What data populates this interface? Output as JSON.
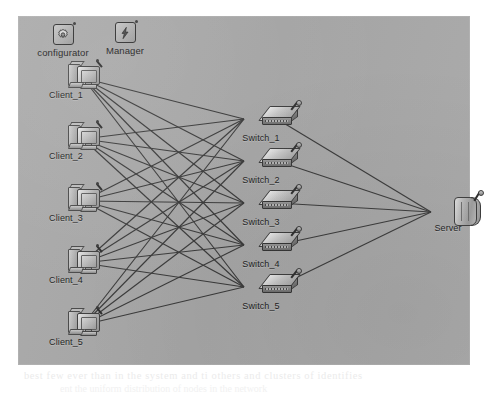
{
  "figure": {
    "kind": "network-topology-diagram",
    "panel_background": "#a9a9a9"
  },
  "app_shortcuts": [
    {
      "name": "configurator",
      "label": "configurator",
      "icon": "gear-icon",
      "x": 45,
      "y": 8
    },
    {
      "name": "manager",
      "label": "Manager",
      "icon": "lightning-bolt-icon",
      "x": 107,
      "y": 6
    }
  ],
  "nodes": {
    "clients": [
      {
        "id": "client_1",
        "label": "Client_1",
        "icon": "workstation-icon",
        "x": 48,
        "y": 45
      },
      {
        "id": "client_2",
        "label": "Client_2",
        "icon": "workstation-icon",
        "x": 48,
        "y": 106
      },
      {
        "id": "client_3",
        "label": "Client_3",
        "icon": "workstation-icon",
        "x": 48,
        "y": 168
      },
      {
        "id": "client_4",
        "label": "Client_4",
        "icon": "workstation-icon",
        "x": 48,
        "y": 230
      },
      {
        "id": "client_5",
        "label": "Client_5",
        "icon": "workstation-icon",
        "x": 48,
        "y": 292
      }
    ],
    "switches": [
      {
        "id": "switch_1",
        "label": "Switch_1",
        "icon": "network-switch-icon",
        "x": 243,
        "y": 88
      },
      {
        "id": "switch_2",
        "label": "Switch_2",
        "icon": "network-switch-icon",
        "x": 243,
        "y": 130
      },
      {
        "id": "switch_3",
        "label": "Switch_3",
        "icon": "network-switch-icon",
        "x": 243,
        "y": 172
      },
      {
        "id": "switch_4",
        "label": "Switch_4",
        "icon": "network-switch-icon",
        "x": 243,
        "y": 214
      },
      {
        "id": "switch_5",
        "label": "Switch_5",
        "icon": "network-switch-icon",
        "x": 243,
        "y": 256
      }
    ],
    "servers": [
      {
        "id": "server",
        "label": "Server",
        "icon": "server-icon",
        "x": 430,
        "y": 178
      }
    ]
  },
  "topology": {
    "client_to_switch": "full-mesh",
    "client_count": 5,
    "switch_count": 5,
    "server_count": 1,
    "client_switch_link_count": 25,
    "switch_server_link_count": 5,
    "link_color": "#3b3b3b"
  },
  "page_bleed": {
    "line1": "best few ever than in the system and ti others and clusters of identifies",
    "line2": "ent the uniform distribution of nodes in the network"
  }
}
